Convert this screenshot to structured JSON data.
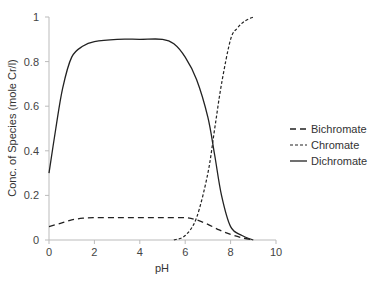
{
  "chart_data": {
    "type": "line",
    "title": "",
    "xlabel": "pH",
    "ylabel": "Conc. of Species (mole Cr/l)",
    "xlim": [
      0,
      10
    ],
    "ylim": [
      0,
      1
    ],
    "x_ticks": [
      "0",
      "2",
      "4",
      "6",
      "8",
      "10"
    ],
    "y_ticks": [
      "0",
      "0.2",
      "0.4",
      "0.6",
      "0.8",
      "1"
    ],
    "grid": false,
    "legend_position": "right",
    "series": [
      {
        "name": "Bichromate",
        "style": "long-dash",
        "x": [
          0,
          0.5,
          1,
          1.5,
          2,
          3,
          4,
          5,
          6,
          6.5,
          7,
          7.5,
          8,
          8.5,
          9
        ],
        "y": [
          0.06,
          0.075,
          0.09,
          0.098,
          0.1,
          0.1,
          0.1,
          0.1,
          0.1,
          0.09,
          0.07,
          0.045,
          0.025,
          0.01,
          0.0
        ]
      },
      {
        "name": "Chromate",
        "style": "short-dash",
        "x": [
          5.5,
          6,
          6.5,
          7,
          7.3,
          7.6,
          8,
          8.3,
          8.6,
          9
        ],
        "y": [
          0.0,
          0.02,
          0.1,
          0.3,
          0.5,
          0.7,
          0.9,
          0.95,
          0.98,
          1.0
        ]
      },
      {
        "name": "Dichromate",
        "style": "solid",
        "x": [
          0,
          0.3,
          0.6,
          1,
          1.5,
          2,
          3,
          4,
          5,
          5.5,
          6,
          6.5,
          7,
          7.3,
          7.6,
          8,
          8.5,
          9
        ],
        "y": [
          0.3,
          0.5,
          0.68,
          0.82,
          0.87,
          0.89,
          0.9,
          0.9,
          0.9,
          0.88,
          0.82,
          0.72,
          0.55,
          0.38,
          0.2,
          0.06,
          0.02,
          0.0
        ]
      }
    ]
  },
  "legend": {
    "items": [
      "Bichromate",
      "Chromate",
      "Dichromate"
    ]
  },
  "axes": {
    "xlabel": "pH",
    "ylabel": "Conc. of Species (mole Cr/l)"
  }
}
